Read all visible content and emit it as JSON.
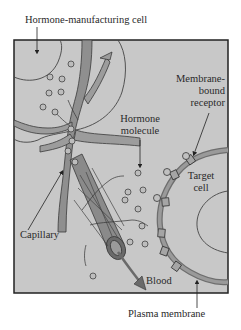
{
  "figure": {
    "colors": {
      "background": "#c8c8c8",
      "border": "#222222",
      "vessel_fill": "#8f8f8f",
      "vessel_dark": "#5a5a5a",
      "membrane": "#7e7e7e",
      "molecule_fill": "#bdbdbd",
      "text": "#2a2a2a"
    },
    "labels": {
      "hormone_cell": "Hormone-manufacturing cell",
      "receptor_line1": "Membrane-",
      "receptor_line2": "bound",
      "receptor_line3": "receptor",
      "hormone_molecule_line1": "Hormone",
      "hormone_molecule_line2": "molecule",
      "target_cell_line1": "Target",
      "target_cell_line2": "cell",
      "capillary": "Capillary",
      "blood": "Blood",
      "plasma_membrane": "Plasma membrane"
    }
  }
}
